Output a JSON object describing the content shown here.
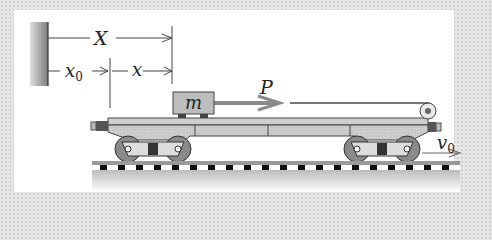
{
  "figure": {
    "labels": {
      "X": "X",
      "x0": "x",
      "x0_sub": "0",
      "x": "x",
      "m": "m",
      "P": "P",
      "v0": "v",
      "v0_sub": "0"
    },
    "colors": {
      "line": "#333333",
      "box_fill": "#bdbdbd",
      "car_fill": "#c8c8c8",
      "panel": "#ffffff",
      "ground": "#d0d0d0"
    }
  }
}
